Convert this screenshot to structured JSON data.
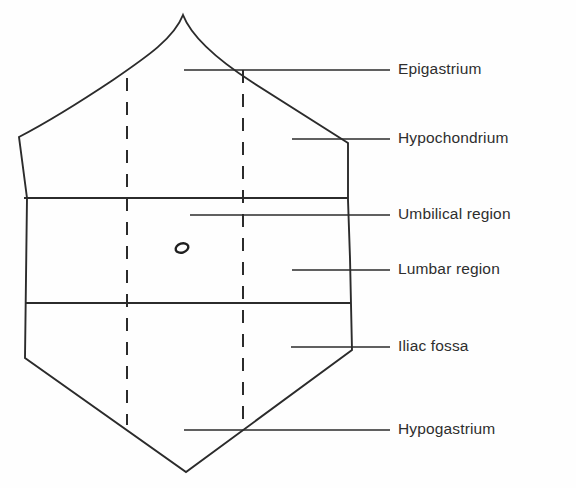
{
  "figure": {
    "background_color": "#fefefe",
    "line_color": "#2b2b2b",
    "text_color": "#2e2e2e"
  },
  "labels": [
    {
      "id": "epigastrium",
      "text": "Epigastrium",
      "x": 398,
      "y": 70,
      "leader_from_x": 184,
      "leader_to_x": 390,
      "leader_y": 70
    },
    {
      "id": "hypochondrium",
      "text": "Hypochondrium",
      "x": 398,
      "y": 139,
      "leader_from_x": 292,
      "leader_to_x": 390,
      "leader_y": 139
    },
    {
      "id": "umbilical",
      "text": "Umbilical region",
      "x": 398,
      "y": 215,
      "leader_from_x": 190,
      "leader_to_x": 390,
      "leader_y": 215
    },
    {
      "id": "lumbar",
      "text": "Lumbar region",
      "x": 398,
      "y": 270,
      "leader_from_x": 292,
      "leader_to_x": 390,
      "leader_y": 270
    },
    {
      "id": "iliac-fossa",
      "text": "Iliac fossa",
      "x": 398,
      "y": 347,
      "leader_from_x": 291,
      "leader_to_x": 390,
      "leader_y": 347
    },
    {
      "id": "hypogastrium",
      "text": "Hypogastrium",
      "x": 398,
      "y": 430,
      "leader_from_x": 184,
      "leader_to_x": 390,
      "leader_y": 430
    }
  ],
  "torso_outline": {
    "description": "abdominal torso silhouette",
    "path": "M 183 15 C 192 38 218 60 252 82 C 288 105 324 128 348 143 L 348 200 L 350 258 L 352 350 L 186 472 L 25 358 L 27 198 L 19 137 C 44 124 80 102 113 80 C 148 56 174 38 183 15 Z"
  },
  "division_lines": {
    "horizontal": [
      {
        "id": "subcostal-plane",
        "x1": 24,
        "x2": 348,
        "y": 198
      },
      {
        "id": "intertubercular-plane",
        "x1": 26,
        "x2": 351,
        "y": 303
      }
    ],
    "vertical_dashed": [
      {
        "id": "left-midclavicular-line",
        "x": 127,
        "y1": 78,
        "y2": 425
      },
      {
        "id": "right-midclavicular-line",
        "x": 243,
        "y1": 70,
        "y2": 430
      }
    ]
  },
  "umbilicus": {
    "id": "umbilicus-marker",
    "shape": "small-oval",
    "cx": 182,
    "cy": 248,
    "rx": 6.5,
    "ry": 4.5,
    "rotation": -18
  }
}
